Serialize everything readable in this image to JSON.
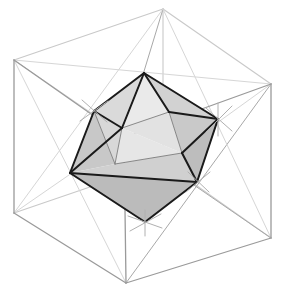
{
  "figure": {
    "title": "Icosahedron inscribed in a cube",
    "canvas": {
      "width": 284,
      "height": 301,
      "background": "#ffffff"
    },
    "colors": {
      "cube_edge_front": "#9a9a9a",
      "cube_edge_back": "#c9c9c9",
      "cube_diagonal": "#d6d6d6",
      "ico_edge": "#1a1a1a",
      "ico_edge_hidden": "#7d7d7d",
      "tick_mark": "#b0b0b0",
      "face_light": "#efefef",
      "face_mid": "#dcdcdc",
      "face_dark": "#c2c2c2",
      "face_darker": "#b4b4b4"
    },
    "cube": {
      "label": "bounding-cube",
      "vertices": {
        "back_top_left": [
          14,
          60
        ],
        "back_top_right": [
          163,
          9
        ],
        "front_top_right": [
          271,
          84
        ],
        "front_top_left": [
          124,
          137
        ],
        "back_bottom_left": [
          14,
          213
        ],
        "back_bottom_right": [
          163,
          162
        ],
        "front_bottom_right": [
          271,
          238
        ],
        "front_bottom_left": [
          126,
          283
        ]
      },
      "edges": [
        [
          "back_top_left",
          "back_top_right"
        ],
        [
          "back_top_right",
          "front_top_right"
        ],
        [
          "front_top_right",
          "front_top_left"
        ],
        [
          "front_top_left",
          "back_top_left"
        ],
        [
          "back_bottom_left",
          "back_bottom_right"
        ],
        [
          "back_bottom_right",
          "front_bottom_right"
        ],
        [
          "front_bottom_right",
          "front_bottom_left"
        ],
        [
          "front_bottom_left",
          "back_bottom_left"
        ],
        [
          "back_top_left",
          "back_bottom_left"
        ],
        [
          "back_top_right",
          "back_bottom_right"
        ],
        [
          "front_top_right",
          "front_bottom_right"
        ],
        [
          "front_top_left",
          "front_bottom_left"
        ]
      ],
      "face_diagonals_visible": 8
    },
    "icosahedron": {
      "label": "inscribed-icosahedron",
      "vertex_count": 12,
      "face_count": 20,
      "edge_count": 30,
      "outline_vertices": [
        [
          144,
          73
        ],
        [
          218,
          119
        ],
        [
          197,
          182
        ],
        [
          145,
          222
        ],
        [
          70,
          173
        ],
        [
          94,
          111
        ]
      ],
      "inner_vertices": [
        [
          122,
          128
        ],
        [
          169,
          112
        ],
        [
          182,
          153
        ],
        [
          115,
          164
        ]
      ],
      "shaded_faces": 10
    },
    "tick_marks": {
      "label": "vertex-tick-marks",
      "locations": [
        [
          218,
          119
        ],
        [
          197,
          182
        ],
        [
          145,
          222
        ],
        [
          94,
          111
        ]
      ],
      "rays_per_vertex": 4
    }
  }
}
